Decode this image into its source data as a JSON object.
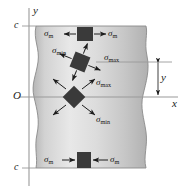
{
  "figure": {
    "background_color": "#ffffff"
  },
  "axes": {
    "y_axis_label": "y",
    "x_axis_label": "x",
    "origin_label": "O",
    "top_tick_label": "c",
    "bottom_tick_label": "c",
    "dimension_label": "y",
    "axis_color": "#8c8c8c",
    "label_color": "#1a1a1a"
  },
  "beam": {
    "fill_light": "#e9e9e9",
    "fill_dark": "#b9b9b9",
    "edge_color": "#8a8a8a"
  },
  "elements": [
    {
      "id": "top-element",
      "rotation_deg": 0,
      "fill_color": "#3a3a3a",
      "left_label": "σ",
      "left_subscript": "m",
      "right_label": "σ",
      "right_subscript": "m",
      "arrow_direction": "outward"
    },
    {
      "id": "middle-element",
      "rotation_deg": 22,
      "fill_color": "#3a3a3a",
      "upper_left_label": "σ",
      "upper_left_subscript": "min",
      "lower_right_label": "σ",
      "lower_right_subscript": "max",
      "arrow_direction": "outward"
    },
    {
      "id": "center-element",
      "rotation_deg": 45,
      "fill_color": "#3a3a3a",
      "upper_right_label": "σ",
      "upper_right_subscript": "max",
      "lower_right_label": "σ",
      "lower_right_subscript": "min",
      "arrow_direction": "inward"
    },
    {
      "id": "bottom-element",
      "rotation_deg": 0,
      "fill_color": "#3a3a3a",
      "left_label": "σ",
      "left_subscript": "m",
      "right_label": "σ",
      "right_subscript": "m",
      "arrow_direction": "inward"
    }
  ],
  "labels": {
    "y_axis": "y",
    "x_axis": "x",
    "origin": "O",
    "tick_top": "c",
    "tick_bottom": "c",
    "dim_y": "y",
    "sigma": "σ",
    "sub_m": "m",
    "sub_min": "min",
    "sub_max": "max"
  }
}
